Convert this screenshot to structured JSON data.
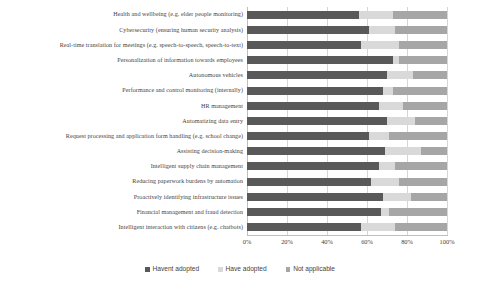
{
  "chart_data": {
    "type": "bar",
    "orientation": "horizontal",
    "stacked": true,
    "stack_mode": "percent",
    "title": "",
    "subtitle": "",
    "xlabel": "",
    "ylabel": "",
    "xlim": [
      0,
      100
    ],
    "xticks": [
      "0%",
      "20%",
      "40%",
      "60%",
      "80%",
      "100%"
    ],
    "xtick_values": [
      0,
      20,
      40,
      60,
      80,
      100
    ],
    "grid": "vertical",
    "legend_position": "bottom",
    "categories": [
      "Health and wellbeing (e.g. elder people monitoring)",
      "Cybersecurity (ensuring human security analysis)",
      "Real-time translation for meetings (e.g. speech-to-speech, speech-to-text)",
      "Personalization of information towards employees",
      "Autonomous vehicles",
      "Performance and control monitoring (internally)",
      "HR management",
      "Automatizing data entry",
      "Request processing and application form handling (e.g. school change)",
      "Assisting decision-making",
      "Intelligent supply chain management",
      "Reducing paperwork burdens by automation",
      "Proactively identifying infrastructure issues",
      "Financial management and fraud detection",
      "Intelligent interaction with citizens (e.g. chatbots)"
    ],
    "series": [
      {
        "name": "Havent adopted",
        "color": "#595959",
        "values": [
          56,
          61,
          57,
          73,
          70,
          68,
          66,
          70,
          61,
          69,
          66,
          62,
          68,
          67,
          57
        ]
      },
      {
        "name": "Have adopted",
        "color": "#d9d9d9",
        "values": [
          17,
          13,
          19,
          3,
          13,
          5,
          12,
          14,
          10,
          18,
          8,
          14,
          14,
          4,
          17
        ]
      },
      {
        "name": "Not applicable",
        "color": "#a6a6a6",
        "values": [
          27,
          26,
          24,
          24,
          17,
          27,
          22,
          16,
          29,
          13,
          26,
          24,
          18,
          29,
          26
        ]
      }
    ]
  },
  "legend": {
    "items": [
      {
        "label": "Havent adopted",
        "color": "#595959"
      },
      {
        "label": "Have adopted",
        "color": "#d9d9d9"
      },
      {
        "label": "Not applicable",
        "color": "#a6a6a6"
      }
    ]
  }
}
